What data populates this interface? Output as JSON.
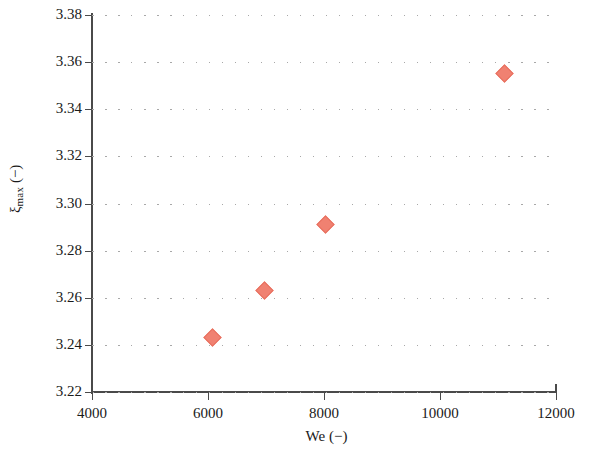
{
  "chart_data": {
    "type": "scatter",
    "title": "",
    "xlabel": "We (−)",
    "ylabel": "ξ_max (−)",
    "ylabel_base": "ξ",
    "ylabel_sub": "max",
    "ylabel_unit": "(−)",
    "xlim": [
      4000,
      12000
    ],
    "ylim": [
      3.22,
      3.38
    ],
    "xticks": [
      4000,
      6000,
      8000,
      10000,
      12000
    ],
    "xtick_labels": [
      "4000",
      "6000",
      "8000",
      "10000",
      "12000"
    ],
    "yticks": [
      3.22,
      3.24,
      3.26,
      3.28,
      3.3,
      3.32,
      3.34,
      3.36,
      3.38
    ],
    "ytick_labels": [
      "3.22",
      "3.24",
      "3.26",
      "3.28",
      "3.30",
      "3.32",
      "3.34",
      "3.36",
      "3.38"
    ],
    "grid": "horizontal-dotted",
    "legend": null,
    "marker": "diamond",
    "marker_color": "#f08171",
    "axis_color": "#4a4a4a",
    "grid_color": "#a8a8a8",
    "background_color": "#ffffff",
    "series": [
      {
        "name": "xi_max",
        "x": [
          6070,
          6970,
          8020,
          11120
        ],
        "y": [
          3.243,
          3.263,
          3.291,
          3.355
        ],
        "points": [
          {
            "x": 6070,
            "y": 3.243
          },
          {
            "x": 6970,
            "y": 3.263
          },
          {
            "x": 8020,
            "y": 3.291
          },
          {
            "x": 11120,
            "y": 3.355
          }
        ]
      }
    ]
  }
}
